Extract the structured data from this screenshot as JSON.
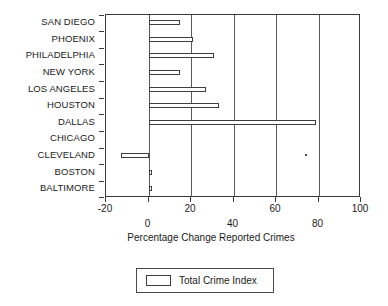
{
  "chart_data": {
    "type": "bar",
    "orientation": "horizontal",
    "title": "",
    "xlabel": "Percentage Change Reported Crimes",
    "ylabel": "",
    "categories": [
      "SAN DIEGO",
      "PHOENIX",
      "PHILADELPHIA",
      "NEW YORK",
      "LOS ANGELES",
      "HOUSTON",
      "DALLAS",
      "CHICAGO",
      "CLEVELAND",
      "BOSTON",
      "BALTIMORE"
    ],
    "series": [
      {
        "name": "Total Crime Index",
        "values": [
          15,
          21,
          31,
          15,
          27,
          33,
          79,
          0,
          -13,
          0.5,
          0.5
        ]
      }
    ],
    "xlim": [
      -20,
      100
    ],
    "xticks": [
      -20,
      0,
      20,
      40,
      60,
      80,
      100
    ],
    "xtick_labels": [
      "-20",
      "0",
      "20",
      "40",
      "60",
      "80",
      "100"
    ],
    "grid": true,
    "grid_axis": "x",
    "legend": {
      "position": "bottom",
      "entries": [
        {
          "label": "Total Crime Index",
          "fill": "#ffffff",
          "stroke": "#3f3f3f"
        }
      ]
    },
    "bar_style": {
      "fill": "#ffffff",
      "stroke": "#3f3f3f"
    },
    "colors": {
      "axis": "#3a3a3a",
      "grid": "#5a5a5a",
      "text": "#1a1a1a",
      "background": "#ffffff"
    }
  }
}
